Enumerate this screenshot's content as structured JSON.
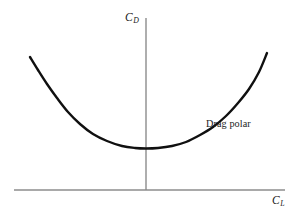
{
  "figure": {
    "background_color": "#ffffff",
    "width": 297,
    "height": 216,
    "axis_color": "#8c8c8c",
    "curve_color": "#101010",
    "text_color": "#1a1a1a"
  },
  "labels": {
    "y_axis_symbol": "C",
    "y_axis_subscript": "D",
    "x_axis_symbol": "C",
    "x_axis_subscript": "L",
    "annotation": "Drag polar"
  },
  "chart_data": {
    "type": "line",
    "title": "",
    "xlabel": "C_L",
    "ylabel": "C_D",
    "grid": false,
    "legend": null,
    "annotations": [
      {
        "text": "Drag polar",
        "x_px": 206,
        "y_px": 119,
        "points_to": "drag-polar-curve"
      }
    ],
    "axes": {
      "y_axis": {
        "label": "C_D",
        "x_px": 146,
        "y_start_px": 18,
        "y_end_px": 190,
        "tick_labels": [],
        "arrow": false
      },
      "x_axis": {
        "label": "C_L",
        "y_px": 190,
        "x_start_px": 14,
        "x_end_px": 285,
        "tick_labels": [],
        "arrow": false
      }
    },
    "series": [
      {
        "name": "Drag polar",
        "description": "Parabolic drag polar: C_D increases quadratically with C_L about a minimum-drag point near C_L = 0",
        "stroke_width": 2.4,
        "color": "#101010",
        "points_px": [
          [
            30,
            57
          ],
          [
            38,
            70
          ],
          [
            47,
            84
          ],
          [
            57,
            98
          ],
          [
            68,
            112
          ],
          [
            80,
            124
          ],
          [
            93,
            134
          ],
          [
            107,
            141
          ],
          [
            122,
            146
          ],
          [
            135,
            148
          ],
          [
            146,
            148.5
          ],
          [
            158,
            148
          ],
          [
            172,
            146
          ],
          [
            186,
            142
          ],
          [
            200,
            135
          ],
          [
            213,
            127
          ],
          [
            226,
            116
          ],
          [
            238,
            103
          ],
          [
            249,
            89
          ],
          [
            259,
            72
          ],
          [
            267,
            53
          ]
        ],
        "vertex_px": [
          146,
          148.5
        ],
        "left_endpoint_px": [
          30,
          57
        ],
        "right_endpoint_px": [
          267,
          53
        ]
      }
    ]
  }
}
